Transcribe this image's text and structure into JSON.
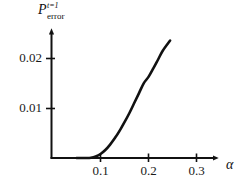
{
  "chart_data": {
    "type": "line",
    "title": "",
    "subtitle": "",
    "ylabel": "P",
    "ylabel_superscript": "t=1",
    "ylabel_subscript": "error",
    "ylabel_full": "P_error^{t=1}",
    "xlabel": "α",
    "xlabel_name": "alpha",
    "xticks": [
      0.1,
      0.2,
      0.3
    ],
    "xtick_labels": [
      "0.1",
      "0.2",
      "0.3"
    ],
    "yticks": [
      0.01,
      0.02
    ],
    "ytick_labels": [
      "0.01",
      "0.02"
    ],
    "xlim": [
      0.0,
      0.348
    ],
    "ylim": [
      0.0,
      0.026
    ],
    "grid": false,
    "legend": null,
    "axis_style": "arrow-tipped L-shaped axes",
    "line_color": "#111111",
    "line_width_px": 2.6,
    "series": [
      {
        "name": "error probability",
        "x": [
          0.05,
          0.06,
          0.07,
          0.08,
          0.09,
          0.1,
          0.11,
          0.12,
          0.13,
          0.14,
          0.15,
          0.16,
          0.17,
          0.18,
          0.19,
          0.2,
          0.21,
          0.22,
          0.23,
          0.245
        ],
        "y": [
          0.0,
          0.0,
          0.0,
          5e-05,
          0.0003,
          0.0008,
          0.0016,
          0.0027,
          0.004,
          0.0055,
          0.0072,
          0.009,
          0.011,
          0.013,
          0.015,
          0.0163,
          0.018,
          0.0198,
          0.0216,
          0.0236
        ]
      }
    ],
    "annotations": []
  },
  "axes": {
    "x_axis_name": "x-axis",
    "y_axis_name": "y-axis"
  }
}
